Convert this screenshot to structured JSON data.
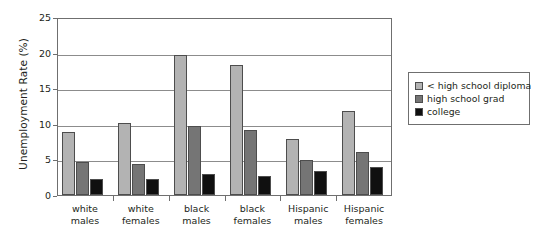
{
  "chart_data": {
    "type": "bar",
    "title": "",
    "xlabel": "",
    "ylabel": "Unemployment Rate (%)",
    "ylim": [
      0,
      25
    ],
    "yticks": [
      "0",
      "5",
      "10",
      "15",
      "20",
      "25"
    ],
    "grid": true,
    "legend_position": "right",
    "categories": [
      "white males",
      "white females",
      "black males",
      "black females",
      "Hispanic males",
      "Hispanic females"
    ],
    "series": [
      {
        "name": "< high school diploma",
        "color": "#b3b3b3",
        "values": [
          8.9,
          10.1,
          19.6,
          18.2,
          7.9,
          11.8
        ]
      },
      {
        "name": "high school grad",
        "color": "#757575",
        "values": [
          4.7,
          4.3,
          9.7,
          9.2,
          4.9,
          6.0
        ]
      },
      {
        "name": "college",
        "color": "#101010",
        "values": [
          2.3,
          2.2,
          2.9,
          2.7,
          3.4,
          3.9
        ]
      }
    ]
  },
  "axis": {
    "y_title": "Unemployment Rate (%)"
  },
  "colors": {
    "axis": "#6f6f6f",
    "grid": "#8c8c8c",
    "bar_border": "#4d4d4d",
    "text": "#231f20"
  }
}
